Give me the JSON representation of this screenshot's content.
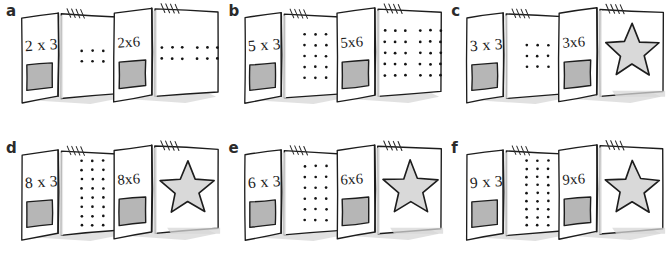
{
  "figure": {
    "background_color": "#ffffff",
    "ink_color": "#1d1d1d",
    "swatch_color": "#b6b6b6",
    "star_fill_color": "#d9d9d9",
    "dot_color": "#141414"
  },
  "panels": [
    {
      "label": "a",
      "left_card": {
        "equation": "2 x 3",
        "content": "dots",
        "rows": 2,
        "cols": 3
      },
      "right_card": {
        "equation": "2x6",
        "content": "dots",
        "rows": 2,
        "cols": 6
      }
    },
    {
      "label": "b",
      "left_card": {
        "equation": "5 x 3",
        "content": "dots",
        "rows": 5,
        "cols": 3
      },
      "right_card": {
        "equation": "5x6",
        "content": "dots",
        "rows": 5,
        "cols": 6
      }
    },
    {
      "label": "c",
      "left_card": {
        "equation": "3 x 3",
        "content": "dots",
        "rows": 3,
        "cols": 3
      },
      "right_card": {
        "equation": "3x6",
        "content": "star",
        "rows": 0,
        "cols": 0
      }
    },
    {
      "label": "d",
      "left_card": {
        "equation": "8 x 3",
        "content": "dots",
        "rows": 8,
        "cols": 3
      },
      "right_card": {
        "equation": "8x6",
        "content": "star",
        "rows": 0,
        "cols": 0
      }
    },
    {
      "label": "e",
      "left_card": {
        "equation": "6 x 3",
        "content": "dots",
        "rows": 6,
        "cols": 3
      },
      "right_card": {
        "equation": "6x6",
        "content": "star",
        "rows": 0,
        "cols": 0
      }
    },
    {
      "label": "f",
      "left_card": {
        "equation": "9 x 3",
        "content": "dots",
        "rows": 9,
        "cols": 3
      },
      "right_card": {
        "equation": "9x6",
        "content": "star",
        "rows": 0,
        "cols": 0
      }
    }
  ]
}
